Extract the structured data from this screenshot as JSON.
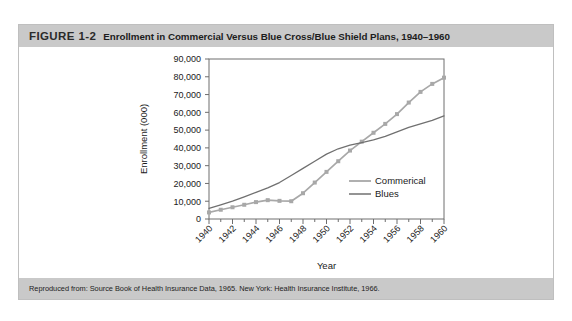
{
  "figure": {
    "number": "FIGURE 1-2",
    "title": "Enrollment in Commercial Versus Blue Cross/Blue Shield Plans, 1940–1960",
    "source": "Reproduced from: Source Book of Health Insurance Data, 1965. New York: Health Insurance Institute, 1966."
  },
  "colors": {
    "band": "#c9c9c9",
    "commercial": "#a8a8a8",
    "blues": "#707070",
    "axis": "#6e6e6e",
    "page": "#ffffff"
  },
  "chart_data": {
    "type": "line",
    "title": "",
    "xlabel": "Year",
    "ylabel": "Enrollment (000)",
    "xlim": [
      1940,
      1960
    ],
    "ylim": [
      0,
      90000
    ],
    "yticks": [
      0,
      10000,
      20000,
      30000,
      40000,
      50000,
      60000,
      70000,
      80000,
      90000
    ],
    "ytick_labels": [
      "0",
      "10,000",
      "20,000",
      "30,000",
      "40,000",
      "50,000",
      "60,000",
      "70,000",
      "80,000",
      "90,000"
    ],
    "xticks": [
      1940,
      1942,
      1944,
      1946,
      1948,
      1950,
      1952,
      1954,
      1956,
      1958,
      1960
    ],
    "xtick_labels": [
      "1940",
      "1942",
      "1944",
      "1946",
      "1948",
      "1950",
      "1952",
      "1954",
      "1956",
      "1958",
      "1960"
    ],
    "x_minor_ticks": [
      1941,
      1943,
      1945,
      1947,
      1949,
      1951,
      1953,
      1955,
      1957,
      1959
    ],
    "grid": false,
    "legend_position": "inside-lower-right",
    "x": [
      1940,
      1941,
      1942,
      1943,
      1944,
      1945,
      1946,
      1947,
      1948,
      1949,
      1950,
      1951,
      1952,
      1953,
      1954,
      1955,
      1956,
      1957,
      1958,
      1959,
      1960
    ],
    "series": [
      {
        "name": "Commerical",
        "color": "#a8a8a8",
        "markers": "square",
        "values": [
          3700,
          5200,
          6600,
          8000,
          9500,
          10600,
          10200,
          10000,
          14500,
          20500,
          26500,
          32500,
          38500,
          43500,
          48500,
          53500,
          59000,
          65500,
          71500,
          76000,
          79500
        ]
      },
      {
        "name": "Blues",
        "color": "#707070",
        "markers": "none",
        "values": [
          6000,
          8000,
          10000,
          12500,
          15000,
          17500,
          20500,
          24500,
          28500,
          32500,
          36500,
          39500,
          41500,
          43000,
          44500,
          46500,
          49000,
          51500,
          53500,
          55500,
          58000
        ]
      }
    ]
  }
}
